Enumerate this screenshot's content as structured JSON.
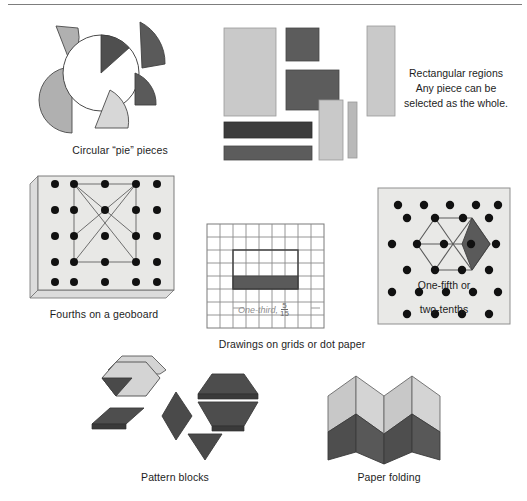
{
  "figure": {
    "divider": "horizontal-rule"
  },
  "palette": {
    "light_gray": "#c9c9c9",
    "lighter_gray": "#dcdcdc",
    "mid_gray": "#a8a8a8",
    "dark_gray": "#595959",
    "darker_gray": "#3b3b3b",
    "board_fill": "#e8e8e6",
    "outline": "#4a4a4a",
    "grid_line": "#8a8a8a",
    "text": "#1d1d1d",
    "white": "#ffffff"
  },
  "sections": {
    "pie": {
      "caption": "Circular “pie” pieces",
      "circle_label": "empty-circle-with-one-wedge",
      "pieces": [
        {
          "name": "small-wedge-top-left",
          "shade": "mid"
        },
        {
          "name": "half-disc-left",
          "shade": "mid"
        },
        {
          "name": "quarter-wedge-top-right",
          "shade": "dark"
        },
        {
          "name": "quarter-wedge-right",
          "shade": "dark"
        },
        {
          "name": "sixth-wedge-bottom",
          "shade": "light"
        },
        {
          "name": "wedge-in-circle",
          "shade": "dark"
        }
      ]
    },
    "rectangles": {
      "line1": "Rectangular regions",
      "line2": "Any piece can be",
      "line3": "selected as the whole.",
      "pieces": [
        {
          "name": "tall-light-rect",
          "shade": "light"
        },
        {
          "name": "small-dark-rect",
          "shade": "dark"
        },
        {
          "name": "wide-dark-rect",
          "shade": "dark"
        },
        {
          "name": "tall-light-rect-right",
          "shade": "light"
        },
        {
          "name": "narrow-light-strip",
          "shade": "light"
        },
        {
          "name": "thin-light-strip",
          "shade": "light"
        },
        {
          "name": "dark-bar-upper",
          "shade": "darker"
        },
        {
          "name": "dark-bar-lower",
          "shade": "dark"
        }
      ]
    },
    "geoboard": {
      "caption": "Fourths on a geoboard",
      "rows": 5,
      "cols": 5,
      "shape": "rectangle-with-diagonals"
    },
    "grid": {
      "caption": "Drawings on grids or dot paper",
      "label_text": "One-third,",
      "fraction_numerator": "5",
      "fraction_denominator": "15",
      "cols": 9,
      "rows": 8
    },
    "dotpaper": {
      "line1": "One-fifth or",
      "line2": "two-tenths",
      "shape": "hexagon-on-isometric-dots",
      "highlight": "dark-rhombus"
    },
    "patternblocks": {
      "caption": "Pattern blocks",
      "pieces": [
        {
          "name": "hexagon-block",
          "shade": "light"
        },
        {
          "name": "triangle-inside-hexagon",
          "shade": "dark"
        },
        {
          "name": "thin-rhombus-block",
          "shade": "dark"
        },
        {
          "name": "blue-rhombus-block",
          "shade": "dark"
        },
        {
          "name": "trapezoid-block-upper",
          "shade": "dark"
        },
        {
          "name": "trapezoid-block-lower",
          "shade": "dark"
        },
        {
          "name": "triangle-block",
          "shade": "dark"
        }
      ]
    },
    "paperfolding": {
      "caption": "Paper folding",
      "folds": 4,
      "top_shade": "light",
      "bottom_shade": "dark"
    }
  }
}
